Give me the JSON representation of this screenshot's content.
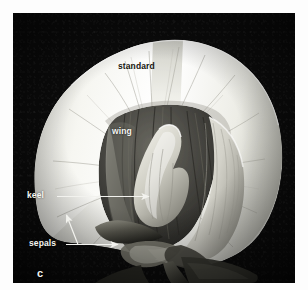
{
  "figure": {
    "panel_letter": "c",
    "background_color": "#0b0b0b",
    "page_color": "#ffffff",
    "label_light_color": "#f6f6f2",
    "label_dark_color": "#15150f",
    "leader_color": "#f2f2ee"
  },
  "labels": {
    "standard": "standard",
    "wing": "wing",
    "keel": "keel",
    "sepals": "sepals"
  },
  "parts": [
    {
      "name": "standard",
      "label": "standard",
      "style": "dark-on-light",
      "leader": "none"
    },
    {
      "name": "wing",
      "label": "wing",
      "style": "light-on-dark",
      "leader": "none"
    },
    {
      "name": "keel",
      "label": "keel",
      "style": "light-on-dark",
      "leader": "single-arrow-right"
    },
    {
      "name": "sepals",
      "label": "sepals",
      "style": "light-on-dark",
      "leader": "branched-two-arrows"
    }
  ]
}
